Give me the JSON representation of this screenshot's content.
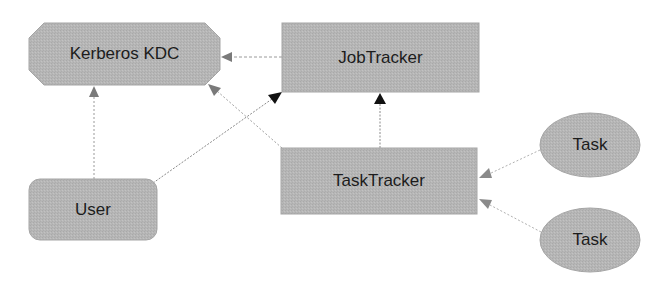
{
  "diagram": {
    "colors": {
      "node_fill": "#b5b5b5",
      "node_stroke": "#a8a8a8",
      "text": "#1c1c1c",
      "edge_gray": "#8a8a8a",
      "arrow_gray": "#7a7a7a",
      "arrow_black": "#111111"
    },
    "nodes": {
      "kerberos": {
        "label": "Kerberos KDC",
        "shape": "octagon"
      },
      "jobtracker": {
        "label": "JobTracker",
        "shape": "rectangle"
      },
      "user": {
        "label": "User",
        "shape": "rounded-rectangle"
      },
      "tasktracker": {
        "label": "TaskTracker",
        "shape": "rectangle"
      },
      "task1": {
        "label": "Task",
        "shape": "ellipse"
      },
      "task2": {
        "label": "Task",
        "shape": "ellipse"
      }
    },
    "edges": [
      {
        "from": "JobTracker",
        "to": "Kerberos KDC",
        "arrow": "gray"
      },
      {
        "from": "User",
        "to": "Kerberos KDC",
        "arrow": "gray"
      },
      {
        "from": "TaskTracker",
        "to": "Kerberos KDC",
        "arrow": "gray"
      },
      {
        "from": "User",
        "to": "JobTracker",
        "arrow": "black"
      },
      {
        "from": "TaskTracker",
        "to": "JobTracker",
        "arrow": "black"
      },
      {
        "from": "Task",
        "to": "TaskTracker",
        "arrow": "gray"
      },
      {
        "from": "Task",
        "to": "TaskTracker",
        "arrow": "gray"
      }
    ]
  }
}
